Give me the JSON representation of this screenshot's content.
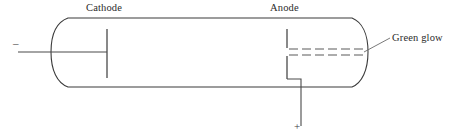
{
  "figure": {
    "name": "discharge-tube-diagram",
    "labels": {
      "cathode": "Cathode",
      "anode": "Anode",
      "green_glow": "Green glow"
    },
    "terminals": {
      "negative_sign": "–",
      "positive_sign": "+"
    },
    "colors": {
      "background": "#ffffff",
      "outline": "#3a3a3a",
      "wire": "#4a4a4a",
      "ray": "#5a5a5a",
      "leader": "#6a6a6a",
      "text": "#2b2b2b"
    },
    "geometry": {
      "tube_left_x": 60,
      "tube_right_x": 360,
      "tube_top_y": 18,
      "tube_bottom_y": 87,
      "axis_y": 52,
      "cathode_x": 107,
      "anode_x": 287,
      "ray_count": 6
    }
  }
}
